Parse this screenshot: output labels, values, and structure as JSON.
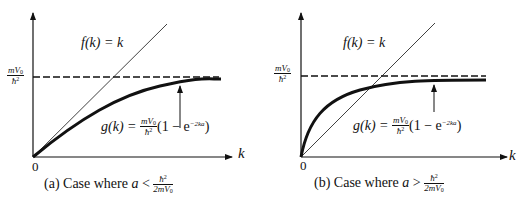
{
  "panels": [
    {
      "id": "a",
      "caption": {
        "prefix": "(a) Case where ",
        "var": "a",
        "relation": " < ",
        "frac_num": "ħ",
        "frac_num_sup": "2",
        "frac_den": "2mV",
        "frac_den_sub": "0"
      },
      "y_level_label": {
        "num": "mV",
        "num_sub": "0",
        "den": "ħ",
        "den_sup": "2"
      },
      "f_label": "f(k) = k",
      "g_label": {
        "lhs": "g(k) = ",
        "num": "mV",
        "num_sub": "0",
        "den": "ħ",
        "den_sup": "2",
        "rhs": "(1 − e",
        "exp": "−2ka",
        "close": ")"
      },
      "x_axis_label": "k",
      "origin_label": "0"
    },
    {
      "id": "b",
      "caption": {
        "prefix": "(b) Case where ",
        "var": "a",
        "relation": " > ",
        "frac_num": "ħ",
        "frac_num_sup": "2",
        "frac_den": "2mV",
        "frac_den_sub": "0"
      },
      "y_level_label": {
        "num": "mV",
        "num_sub": "0",
        "den": "ħ",
        "den_sup": "2"
      },
      "f_label": "f(k) = k",
      "g_label": {
        "lhs": "g(k) = ",
        "num": "mV",
        "num_sub": "0",
        "den": "ħ",
        "den_sup": "2",
        "rhs": "(1 − e",
        "exp": "−2ka",
        "close": ")"
      },
      "x_axis_label": "k",
      "origin_label": "0"
    }
  ],
  "colors": {
    "ink": "#111111",
    "background": "#ffffff"
  }
}
